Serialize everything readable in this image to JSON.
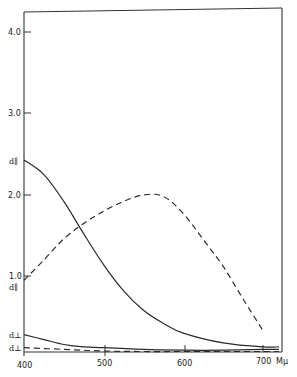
{
  "chart_data": {
    "type": "line",
    "title": "",
    "xlabel": "mμ",
    "ylabel": "",
    "xlim": [
      400,
      720
    ],
    "ylim": [
      0,
      4.2
    ],
    "grid": false,
    "legend": "none (curves labeled at left axis)",
    "x_ticks": [
      400,
      500,
      600,
      700
    ],
    "x_tick_labels": [
      "400",
      "500",
      "600",
      "700"
    ],
    "x_unit_label": "Mμ",
    "y_ticks": [
      1.0,
      2.0,
      3.0,
      4.0
    ],
    "y_tick_labels": [
      "1.0",
      "2.0",
      "3.0",
      "4.0"
    ],
    "series": [
      {
        "name": "d∥ (solid, upper)",
        "label": "d∥",
        "style": "solid",
        "x": [
          400,
          425,
          450,
          475,
          500,
          525,
          550,
          575,
          600,
          650,
          700,
          720
        ],
        "values": [
          2.43,
          2.25,
          1.92,
          1.52,
          1.14,
          0.82,
          0.58,
          0.42,
          0.3,
          0.18,
          0.13,
          0.13
        ]
      },
      {
        "name": "d∥ (dashed)",
        "label": "d∥",
        "style": "dashed",
        "x": [
          400,
          425,
          450,
          475,
          500,
          525,
          550,
          575,
          600,
          625,
          650,
          675,
          700
        ],
        "values": [
          0.95,
          1.2,
          1.46,
          1.65,
          1.8,
          1.92,
          2.0,
          1.98,
          1.77,
          1.45,
          1.12,
          0.72,
          0.33
        ]
      },
      {
        "name": "d⊥ (solid, lower)",
        "label": "d⊥",
        "style": "solid",
        "x": [
          400,
          425,
          450,
          475,
          500,
          550,
          600,
          650,
          700,
          720
        ],
        "values": [
          0.28,
          0.22,
          0.16,
          0.13,
          0.12,
          0.1,
          0.09,
          0.09,
          0.1,
          0.1
        ]
      },
      {
        "name": "d⊥ (dashed)",
        "label": "d⊥",
        "style": "dashed",
        "x": [
          400,
          450,
          500,
          550,
          600,
          650,
          700,
          720
        ],
        "values": [
          0.12,
          0.1,
          0.08,
          0.07,
          0.07,
          0.07,
          0.07,
          0.07
        ]
      }
    ],
    "annotations": [
      {
        "text": "d∥",
        "at": "y-axis, value 2.43 (solid curve start)"
      },
      {
        "text": "d∥",
        "at": "y-axis, just below 1.0 (dashed curve start)"
      },
      {
        "text": "d⊥",
        "at": "y-axis, value 0.28 (solid lower curve start)"
      },
      {
        "text": "d⊥",
        "at": "y-axis, value 0.12 (dashed lower curve start)"
      }
    ]
  },
  "labels": {
    "y4": "4.0",
    "y3": "3.0",
    "y2": "2.0",
    "y1": "1.0",
    "x400": "400",
    "x500": "500",
    "x600": "600",
    "x700": "700",
    "xunit": "Mμ",
    "d_par_solid": "d∥",
    "d_par_dashed": "d∥",
    "d_perp_solid": "d⊥",
    "d_perp_dashed": "d⊥"
  }
}
